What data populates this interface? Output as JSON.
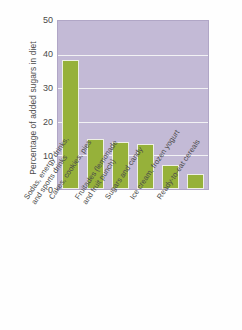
{
  "chart_data": {
    "type": "bar",
    "title": "",
    "xlabel": "",
    "ylabel": "Percentage of added sugars in diet",
    "ylim": [
      0,
      50
    ],
    "yticks": [
      0,
      10,
      20,
      30,
      40,
      50
    ],
    "grid": true,
    "legend": "none",
    "categories": [
      "Sodas, energy drinks, and sports drinks",
      "Cakes, cookies, pies",
      "Fruitades (lemonade and fruit punch)",
      "Sugars and candy",
      "Ice cream, frozen yogurt",
      "Ready-to-eat cereals"
    ],
    "category_lines": [
      [
        "Sodas, energy drinks,",
        "and sports drinks"
      ],
      [
        "Cakes, cookies, pies"
      ],
      [
        "Fruitades (lemonade",
        "and fruit punch)"
      ],
      [
        "Sugars and candy"
      ],
      [
        "Ice cream, frozen yogurt"
      ],
      [
        "Ready-to-eat cereals"
      ]
    ],
    "values": [
      38.5,
      14.8,
      14.1,
      13.5,
      7.0,
      4.6
    ],
    "colors": {
      "bar": "#96b13a",
      "bar_edge": "#eef0e4",
      "plot_background": "#c3bad6",
      "gridline": "#f2f2f4",
      "text": "#4a4a4a",
      "page_background": "#ffffff"
    }
  }
}
